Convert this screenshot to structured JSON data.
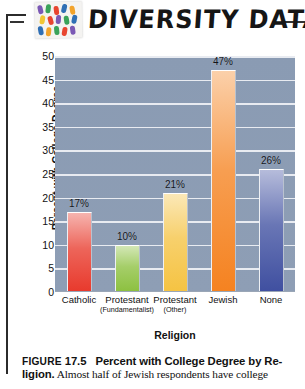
{
  "header": {
    "title": "DIVERSITY DATA",
    "logo_name": "people-mosaic-logo"
  },
  "chart_data": {
    "type": "bar",
    "xlabel": "Religion",
    "ylabel": "Percent with College Degree",
    "ylim": [
      0,
      50
    ],
    "yticks": [
      0,
      5,
      10,
      15,
      20,
      25,
      30,
      35,
      40,
      45,
      50
    ],
    "grid": true,
    "legend": "none",
    "categories": [
      "Catholic",
      "Protestant (Fundamentalist)",
      "Protestant (Other)",
      "Jewish",
      "None"
    ],
    "category_labels": [
      {
        "main": "Catholic",
        "sub": ""
      },
      {
        "main": "Protestant",
        "sub": "(Fundamentalist)"
      },
      {
        "main": "Protestant",
        "sub": "(Other)"
      },
      {
        "main": "Jewish",
        "sub": ""
      },
      {
        "main": "None",
        "sub": ""
      }
    ],
    "values": [
      17,
      10,
      21,
      47,
      26
    ],
    "data_labels": [
      "17%",
      "10%",
      "21%",
      "47%",
      "26%"
    ],
    "bar_colors": [
      "#e8392c",
      "#8cc03f",
      "#f5c342",
      "#f58220",
      "#3f4fa0"
    ],
    "plot_background": "#8e9eb5",
    "gridline_color": "#f0f2f6"
  },
  "caption": {
    "figure_word": "FIGURE",
    "figure_number": "17.5",
    "title": "Percent with College Degree by Re-",
    "title_cont": "ligion.",
    "body": " Almost half of Jewish respondents have college"
  }
}
